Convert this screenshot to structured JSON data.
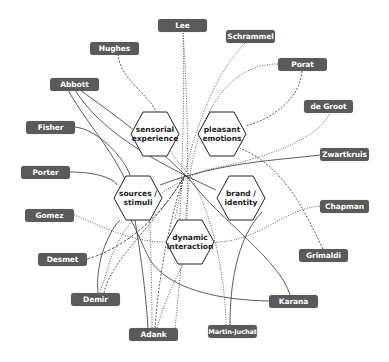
{
  "hubs": [
    {
      "id": "sensorial",
      "label_1": "sensorial",
      "label_2": "experience",
      "cx": 155,
      "cy": 134
    },
    {
      "id": "pleasant",
      "label_1": "pleasant",
      "label_2": "emotions",
      "cx": 222,
      "cy": 134
    },
    {
      "id": "sources",
      "label_1": "sources /",
      "label_2": "stimuli",
      "cx": 138,
      "cy": 198
    },
    {
      "id": "brand",
      "label_1": "brand /",
      "label_2": "identity",
      "cx": 241,
      "cy": 198
    },
    {
      "id": "dynamic",
      "label_1": "dynamic",
      "label_2": "interaction",
      "cx": 190,
      "cy": 242
    }
  ],
  "authors": [
    {
      "name": "Lee",
      "x": 158,
      "y": 19
    },
    {
      "name": "Schrammel",
      "x": 226,
      "y": 30
    },
    {
      "name": "Hughes",
      "x": 90,
      "y": 42
    },
    {
      "name": "Porat",
      "x": 278,
      "y": 58
    },
    {
      "name": "Abbott",
      "x": 50,
      "y": 78
    },
    {
      "name": "de Groot",
      "x": 304,
      "y": 100
    },
    {
      "name": "Fisher",
      "x": 26,
      "y": 121
    },
    {
      "name": "Zwartkruis",
      "x": 320,
      "y": 148
    },
    {
      "name": "Porter",
      "x": 21,
      "y": 166
    },
    {
      "name": "Chapman",
      "x": 320,
      "y": 200
    },
    {
      "name": "Gomez",
      "x": 25,
      "y": 209
    },
    {
      "name": "Grimaldi",
      "x": 299,
      "y": 249
    },
    {
      "name": "Desmet",
      "x": 38,
      "y": 253
    },
    {
      "name": "Demir",
      "x": 71,
      "y": 293
    },
    {
      "name": "Karana",
      "x": 269,
      "y": 295
    },
    {
      "name": "Martin-Juchat",
      "x": 208,
      "y": 325
    },
    {
      "name": "Adank",
      "x": 129,
      "y": 328
    }
  ],
  "legend": {
    "solid": "solid line",
    "dotted": "dotted line",
    "dashed": "dashed line"
  },
  "colors": {
    "pill": "#5a5a5a",
    "pill_text": "#ffffff",
    "hex_stroke": "#222222",
    "line": "#333333"
  }
}
